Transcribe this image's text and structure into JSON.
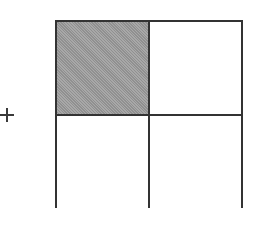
{
  "diagram": {
    "operator": {
      "symbol": "+",
      "icon": "plus-icon",
      "x": 0,
      "y": 108,
      "size": 14
    },
    "grid": {
      "x": 55,
      "y": 20,
      "rows": 2,
      "cols": 2,
      "cell_width": 95,
      "cell_height": 96,
      "border_color": "#333333",
      "shaded_color": "#9c9c9c",
      "cells": [
        {
          "row": 0,
          "col": 0,
          "shaded": true
        },
        {
          "row": 0,
          "col": 1,
          "shaded": false
        },
        {
          "row": 1,
          "col": 0,
          "shaded": false
        },
        {
          "row": 1,
          "col": 1,
          "shaded": false
        }
      ],
      "shaded_fraction": "1/4"
    }
  }
}
